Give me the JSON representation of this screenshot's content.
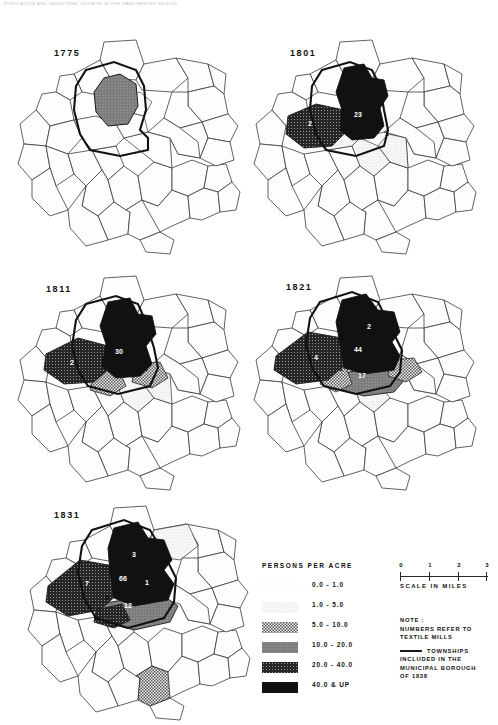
{
  "page_header": "POPULATION AND INDUSTRIAL GROWTH IN THE MANCHESTER REGION",
  "maps": [
    {
      "year": "1775",
      "mill_labels": []
    },
    {
      "year": "1801",
      "mill_labels": [
        {
          "value": "2",
          "x": 62,
          "y": 92,
          "color": "#ffffff"
        },
        {
          "value": "23",
          "x": 110,
          "y": 83,
          "color": "#ffffff"
        },
        {
          "value": "1",
          "x": 139,
          "y": 102,
          "color": "#111111"
        }
      ]
    },
    {
      "year": "1811",
      "mill_labels": [
        {
          "value": "2",
          "x": 60,
          "y": 95,
          "color": "#ffffff"
        },
        {
          "value": "30",
          "x": 107,
          "y": 84,
          "color": "#ffffff"
        },
        {
          "value": "2",
          "x": 134,
          "y": 101,
          "color": "#111111"
        }
      ]
    },
    {
      "year": "1821",
      "mill_labels": [
        {
          "value": "2",
          "x": 121,
          "y": 59,
          "color": "#ffffff"
        },
        {
          "value": "44",
          "x": 110,
          "y": 82,
          "color": "#ffffff"
        },
        {
          "value": "4",
          "x": 68,
          "y": 90,
          "color": "#ffffff"
        },
        {
          "value": "1",
          "x": 93,
          "y": 101,
          "color": "#111111"
        },
        {
          "value": "17",
          "x": 114,
          "y": 108,
          "color": "#ffffff"
        },
        {
          "value": "1",
          "x": 137,
          "y": 98,
          "color": "#111111"
        }
      ]
    },
    {
      "year": "1831",
      "mill_labels": [
        {
          "value": "3",
          "x": 112,
          "y": 57,
          "color": "#ffffff"
        },
        {
          "value": "1",
          "x": 140,
          "y": 57,
          "color": "#111111"
        },
        {
          "value": "66",
          "x": 101,
          "y": 81,
          "color": "#ffffff"
        },
        {
          "value": "7",
          "x": 65,
          "y": 86,
          "color": "#ffffff"
        },
        {
          "value": "1",
          "x": 125,
          "y": 85,
          "color": "#ffffff"
        },
        {
          "value": "2",
          "x": 85,
          "y": 100,
          "color": "#111111"
        },
        {
          "value": "1",
          "x": 124,
          "y": 99,
          "color": "#111111"
        },
        {
          "value": "12",
          "x": 106,
          "y": 108,
          "color": "#ffffff"
        }
      ]
    }
  ],
  "legend": {
    "title": "PERSONS  PER   ACRE",
    "classes": [
      {
        "label": "0.0  -   1.0",
        "pattern": "stipple-1"
      },
      {
        "label": "1.0  -   5.0",
        "pattern": "stipple-2"
      },
      {
        "label": "5.0  -  10.0",
        "pattern": "checker"
      },
      {
        "label": "10.0 - 20.0",
        "pattern": "dense-grey"
      },
      {
        "label": "20.0 - 40.0",
        "pattern": "dark-grid"
      },
      {
        "label": "40.0  & UP",
        "pattern": "solid-black"
      }
    ]
  },
  "scale": {
    "ticks": [
      "0",
      "1",
      "2",
      "3"
    ],
    "caption": "SCALE   IN   MILES"
  },
  "note": {
    "heading": "NOTE :",
    "line1": "NUMBERS  REFER  TO",
    "line2": "TEXTILE  MILLS",
    "line3": "TOWNSHIPS",
    "line4": "INCLUDED  IN  THE",
    "line5": "MUNICIPAL  BOROUGH",
    "line6": "OF  1838"
  }
}
